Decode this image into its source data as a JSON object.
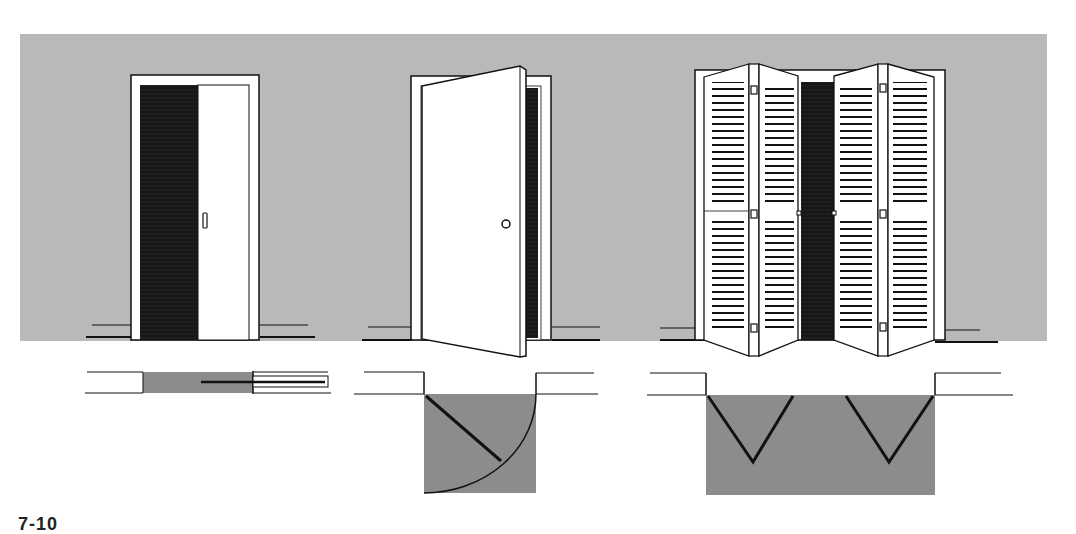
{
  "figure": {
    "label": "7-10",
    "colors": {
      "wall": "#b9b9b9",
      "plan_fill": "#8c8c8c",
      "opening_dark": "#1a1a1a",
      "line": "#111111",
      "door": "#ffffff"
    },
    "doors": [
      {
        "name": "pocket-sliding-door",
        "type": "Pocket / sliding door",
        "plan": "door slides into wall cavity"
      },
      {
        "name": "hinged-swing-door",
        "type": "Hinged swing door",
        "plan": "quarter-circle swing arc"
      },
      {
        "name": "bifold-louvered-door",
        "type": "Bi-fold louvered doors",
        "plan": "two V-shaped folds"
      }
    ]
  }
}
